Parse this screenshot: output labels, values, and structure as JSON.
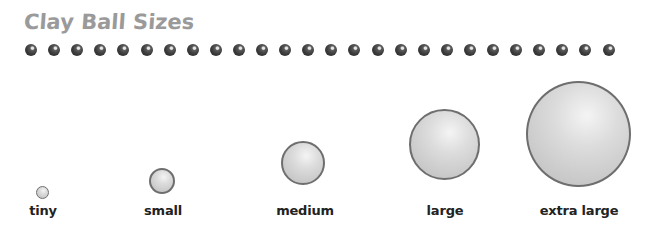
{
  "title": "Clay Ball Sizes",
  "dot_row": {
    "count": 26,
    "color": "#3a3a3a"
  },
  "balls": [
    {
      "label": "tiny",
      "diameter": 13,
      "cx": 42,
      "cy": 192
    },
    {
      "label": "small",
      "diameter": 26,
      "cx": 162,
      "cy": 181
    },
    {
      "label": "medium",
      "diameter": 44,
      "cx": 303,
      "cy": 163
    },
    {
      "label": "large",
      "diameter": 70,
      "cx": 444,
      "cy": 144
    },
    {
      "label": "extra large",
      "diameter": 104,
      "cx": 578,
      "cy": 134
    }
  ],
  "colors": {
    "title": "#9a9a9a",
    "ball_fill": "#d6d6d6",
    "ball_outline": "#6e6e6e",
    "label": "#222222"
  }
}
